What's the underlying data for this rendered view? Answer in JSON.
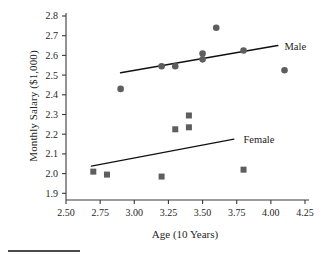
{
  "chart_data": {
    "type": "scatter",
    "title": "",
    "xlabel": "Age (10 Years)",
    "ylabel": "Monthly Salary ($1,000)",
    "xlim": [
      2.5,
      4.25
    ],
    "ylim": [
      1.85,
      2.8
    ],
    "xticks": [
      "2.50",
      "2.75",
      "3.00",
      "3.25",
      "3.50",
      "3.75",
      "4.00",
      "4.25"
    ],
    "xtick_values": [
      2.5,
      2.75,
      3.0,
      3.25,
      3.5,
      3.75,
      4.0,
      4.25
    ],
    "yticks": [
      "2.8",
      "2.7",
      "2.6",
      "2.5",
      "2.4",
      "2.3",
      "2.2",
      "2.1",
      "2.0",
      "1.9"
    ],
    "ytick_values": [
      2.8,
      2.7,
      2.6,
      2.5,
      2.4,
      2.3,
      2.2,
      2.1,
      2.0,
      1.9
    ],
    "grid": false,
    "legend_position": "inline-right-of-lines",
    "series": [
      {
        "name": "Male",
        "marker": "circle",
        "color": "#5e5e5e",
        "points": [
          {
            "x": 2.9,
            "y": 2.43
          },
          {
            "x": 3.2,
            "y": 2.545
          },
          {
            "x": 3.3,
            "y": 2.545
          },
          {
            "x": 3.5,
            "y": 2.61
          },
          {
            "x": 3.5,
            "y": 2.58
          },
          {
            "x": 3.6,
            "y": 2.74
          },
          {
            "x": 3.8,
            "y": 2.625
          },
          {
            "x": 4.1,
            "y": 2.525
          }
        ],
        "fit_line": {
          "x1": 2.9,
          "y1": 2.512,
          "x2": 4.05,
          "y2": 2.65
        }
      },
      {
        "name": "Female",
        "marker": "square",
        "color": "#5e5e5e",
        "points": [
          {
            "x": 2.7,
            "y": 2.01
          },
          {
            "x": 2.8,
            "y": 1.995
          },
          {
            "x": 3.2,
            "y": 1.985
          },
          {
            "x": 3.3,
            "y": 2.225
          },
          {
            "x": 3.4,
            "y": 2.295
          },
          {
            "x": 3.4,
            "y": 2.235
          },
          {
            "x": 3.8,
            "y": 2.02
          }
        ],
        "fit_line": {
          "x1": 2.685,
          "y1": 2.038,
          "x2": 3.73,
          "y2": 2.175
        }
      }
    ],
    "annotations": [
      {
        "text": "Male",
        "x": 4.1,
        "y": 2.645
      },
      {
        "text": "Female",
        "x": 3.8,
        "y": 2.175
      }
    ]
  }
}
